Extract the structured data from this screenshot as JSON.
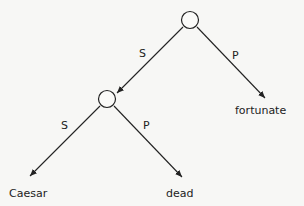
{
  "diagram": {
    "type": "tree",
    "nodes": [
      {
        "id": "root",
        "label": "",
        "shape": "circle"
      },
      {
        "id": "inner",
        "label": "",
        "shape": "circle"
      },
      {
        "id": "fortunate",
        "label": "fortunate"
      },
      {
        "id": "caesar",
        "label": "Caesar"
      },
      {
        "id": "dead",
        "label": "dead"
      }
    ],
    "edges": [
      {
        "from": "root",
        "to": "inner",
        "label": "S"
      },
      {
        "from": "root",
        "to": "fortunate",
        "label": "P"
      },
      {
        "from": "inner",
        "to": "caesar",
        "label": "S"
      },
      {
        "from": "inner",
        "to": "dead",
        "label": "P"
      }
    ]
  }
}
